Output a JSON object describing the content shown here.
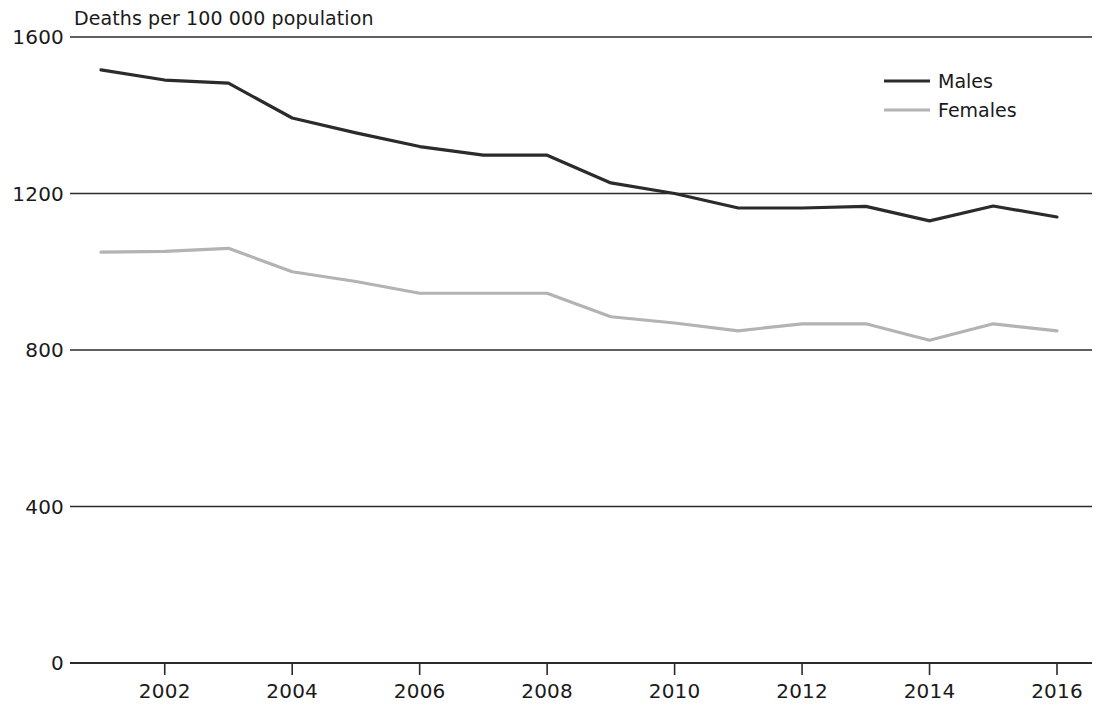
{
  "chart_data": {
    "type": "line",
    "title": "Deaths per 100 000 population",
    "xlabel": "",
    "ylabel": "",
    "x": [
      2001,
      2002,
      2003,
      2004,
      2005,
      2006,
      2007,
      2008,
      2009,
      2010,
      2011,
      2012,
      2013,
      2014,
      2015,
      2016
    ],
    "xlim": [
      2001,
      2016
    ],
    "ylim": [
      0,
      1600
    ],
    "yticks": [
      0,
      400,
      800,
      1200,
      1600
    ],
    "ytick_labels": [
      "0",
      "400",
      "800",
      "1200",
      "1600"
    ],
    "xticks": [
      2002,
      2004,
      2006,
      2008,
      2010,
      2012,
      2014,
      2016
    ],
    "xtick_labels": [
      "2002",
      "2004",
      "2006",
      "2008",
      "2010",
      "2012",
      "2014",
      "2016"
    ],
    "grid": true,
    "grid_axis": "y",
    "legend_position": "top-right",
    "series": [
      {
        "name": "Males",
        "color": "#2b2b2b",
        "values": [
          1516,
          1490,
          1482,
          1393,
          1355,
          1320,
          1298,
          1298,
          1227,
          1200,
          1163,
          1163,
          1167,
          1130,
          1168,
          1140
        ]
      },
      {
        "name": "Females",
        "color": "#b3b3b3",
        "values": [
          1050,
          1052,
          1060,
          1000,
          975,
          945,
          945,
          945,
          885,
          869,
          849,
          867,
          867,
          825,
          867,
          849
        ]
      }
    ]
  },
  "legend": {
    "items": [
      {
        "label": "Males",
        "color": "#2b2b2b"
      },
      {
        "label": "Females",
        "color": "#b3b3b3"
      }
    ]
  },
  "axis_color": "#2b2b2b"
}
